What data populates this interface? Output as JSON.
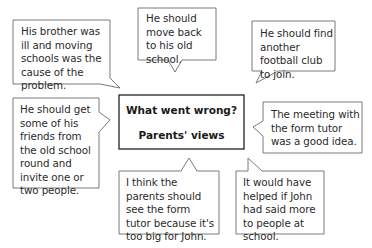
{
  "diagram": {
    "type": "speech-bubble mind map",
    "center": {
      "title": "What went wrong?",
      "subtitle": "Parents' views"
    },
    "bubbles": [
      {
        "id": "top-left",
        "text": "His brother was ill and moving schools was the cause of the problem."
      },
      {
        "id": "top-center",
        "text": "He should move back to his old school."
      },
      {
        "id": "top-right",
        "text": "He should find another football club to join."
      },
      {
        "id": "middle-left",
        "text": "He should get some of his friends from the old school round and invite one or two people."
      },
      {
        "id": "middle-right",
        "text": "The meeting with the form tutor was a good idea."
      },
      {
        "id": "bottom-center",
        "text": "I think the parents should see the form tutor because it's too big for John."
      },
      {
        "id": "bottom-right",
        "text": "It would have helped if John had said more to people at school."
      }
    ]
  },
  "colors": {
    "bubble_border": "#6b6b6b",
    "center_border": "#222222",
    "text": "#2a2a2a",
    "background": "#ffffff"
  }
}
